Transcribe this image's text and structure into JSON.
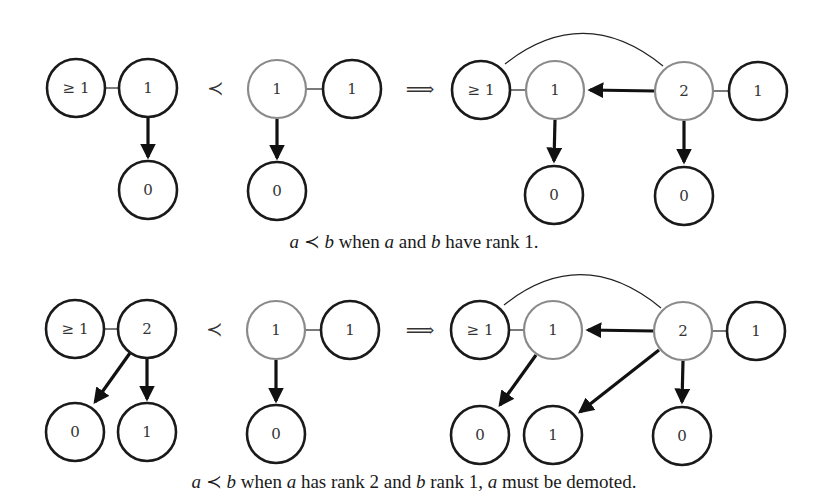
{
  "figure": {
    "colors": {
      "node_stroke": "#1a1a1a",
      "highlight_stroke": "#8a8a8a",
      "edge": "#111111",
      "background": "#ffffff"
    },
    "symbols": {
      "precedes": "≺",
      "implies": "⟹"
    },
    "panels": [
      {
        "id": "rank1-vs-rank1",
        "caption": {
          "a": "a",
          "prec": "≺",
          "b": "b",
          "text1": " when ",
          "a2": "a",
          "text2": " and ",
          "b2": "b",
          "text3": " have rank 1."
        },
        "left_tree": {
          "nodes": [
            {
              "id": "L1",
              "label": "≥ 1",
              "x": 76,
              "y": 88,
              "highlight": false
            },
            {
              "id": "L2",
              "label": "1",
              "x": 148,
              "y": 88,
              "highlight": false
            },
            {
              "id": "L3",
              "label": "0",
              "x": 148,
              "y": 190,
              "highlight": false
            }
          ],
          "edges": [
            {
              "from": "L1",
              "to": "L2",
              "type": "sibling"
            },
            {
              "from": "L2",
              "to": "L3",
              "type": "child"
            }
          ]
        },
        "right_tree": {
          "nodes": [
            {
              "id": "M1",
              "label": "1",
              "x": 277,
              "y": 89,
              "highlight": true
            },
            {
              "id": "M2",
              "label": "1",
              "x": 352,
              "y": 89,
              "highlight": false
            },
            {
              "id": "M3",
              "label": "0",
              "x": 277,
              "y": 191,
              "highlight": false
            }
          ],
          "edges": [
            {
              "from": "M1",
              "to": "M2",
              "type": "sibling"
            },
            {
              "from": "M1",
              "to": "M3",
              "type": "child"
            }
          ]
        },
        "result": {
          "nodes": [
            {
              "id": "R1",
              "label": "≥ 1",
              "x": 481,
              "y": 90,
              "highlight": false
            },
            {
              "id": "R2",
              "label": "1",
              "x": 555,
              "y": 90,
              "highlight": true
            },
            {
              "id": "R3",
              "label": "2",
              "x": 684,
              "y": 91,
              "highlight": true
            },
            {
              "id": "R4",
              "label": "1",
              "x": 758,
              "y": 91,
              "highlight": false
            },
            {
              "id": "R5",
              "label": "0",
              "x": 554,
              "y": 195,
              "highlight": false
            },
            {
              "id": "R6",
              "label": "0",
              "x": 684,
              "y": 196,
              "highlight": false
            }
          ],
          "edges": [
            {
              "from": "R1",
              "to": "R2",
              "type": "sibling"
            },
            {
              "from": "R3",
              "to": "R4",
              "type": "sibling"
            },
            {
              "from": "R1",
              "to": "R3",
              "type": "arc"
            },
            {
              "from": "R3",
              "to": "R2",
              "type": "child"
            },
            {
              "from": "R2",
              "to": "R5",
              "type": "child"
            },
            {
              "from": "R3",
              "to": "R6",
              "type": "child"
            }
          ]
        }
      },
      {
        "id": "rank2-vs-rank1",
        "caption": {
          "a": "a",
          "prec": "≺",
          "b": "b",
          "text1": " when ",
          "a2": "a",
          "text2": " has rank 2 and ",
          "b2": "b",
          "text3": " rank 1, ",
          "a3": "a",
          "text4": " must be demoted."
        },
        "left_tree": {
          "nodes": [
            {
              "id": "L1",
              "label": "≥ 1",
              "x": 75,
              "y": 329,
              "highlight": false
            },
            {
              "id": "L2",
              "label": "2",
              "x": 147,
              "y": 329,
              "highlight": false
            },
            {
              "id": "L3",
              "label": "0",
              "x": 75,
              "y": 432,
              "highlight": false
            },
            {
              "id": "L4",
              "label": "1",
              "x": 147,
              "y": 432,
              "highlight": false
            }
          ],
          "edges": [
            {
              "from": "L1",
              "to": "L2",
              "type": "sibling"
            },
            {
              "from": "L2",
              "to": "L3",
              "type": "child"
            },
            {
              "from": "L2",
              "to": "L4",
              "type": "child"
            }
          ]
        },
        "right_tree": {
          "nodes": [
            {
              "id": "M1",
              "label": "1",
              "x": 276,
              "y": 330,
              "highlight": true
            },
            {
              "id": "M2",
              "label": "1",
              "x": 350,
              "y": 330,
              "highlight": false
            },
            {
              "id": "M3",
              "label": "0",
              "x": 276,
              "y": 434,
              "highlight": false
            }
          ],
          "edges": [
            {
              "from": "M1",
              "to": "M2",
              "type": "sibling"
            },
            {
              "from": "M1",
              "to": "M3",
              "type": "child"
            }
          ]
        },
        "result": {
          "nodes": [
            {
              "id": "R1",
              "label": "≥ 1",
              "x": 480,
              "y": 330,
              "highlight": false
            },
            {
              "id": "R2",
              "label": "1",
              "x": 553,
              "y": 330,
              "highlight": true
            },
            {
              "id": "R3",
              "label": "2",
              "x": 683,
              "y": 331,
              "highlight": true
            },
            {
              "id": "R4",
              "label": "1",
              "x": 756,
              "y": 331,
              "highlight": false
            },
            {
              "id": "R5",
              "label": "0",
              "x": 480,
              "y": 435,
              "highlight": false
            },
            {
              "id": "R6",
              "label": "1",
              "x": 553,
              "y": 435,
              "highlight": false
            },
            {
              "id": "R7",
              "label": "0",
              "x": 682,
              "y": 436,
              "highlight": false
            }
          ],
          "edges": [
            {
              "from": "R1",
              "to": "R2",
              "type": "sibling"
            },
            {
              "from": "R3",
              "to": "R4",
              "type": "sibling"
            },
            {
              "from": "R1",
              "to": "R3",
              "type": "arc"
            },
            {
              "from": "R3",
              "to": "R2",
              "type": "child"
            },
            {
              "from": "R2",
              "to": "R5",
              "type": "child"
            },
            {
              "from": "R3",
              "to": "R6",
              "type": "child"
            },
            {
              "from": "R3",
              "to": "R7",
              "type": "child"
            }
          ]
        }
      }
    ]
  }
}
